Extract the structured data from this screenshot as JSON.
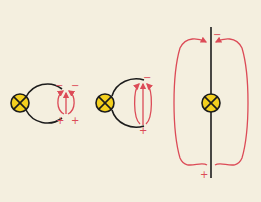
{
  "diagram": {
    "title": "",
    "background_color": "#f4efdf",
    "wire_color": "#1c1c1c",
    "field_color": "#dc4b57",
    "bulb_color": "#f4d01e",
    "panels": [
      {
        "id": "small-gap",
        "description": "Bulb connected to open wire loop with small gap; short field loops across gap",
        "signs": {
          "top_left": "−",
          "top_right": "−",
          "bottom_left": "+",
          "bottom_right": "+"
        }
      },
      {
        "id": "medium-gap",
        "description": "Bulb connected to wire loop with wider gap; elliptical field lines with arrow pointing up",
        "signs": {
          "top": "−",
          "bottom": "+"
        }
      },
      {
        "id": "straight-antenna",
        "description": "Bulb in straight vertical wire (dipole); large field loops from bottom to top",
        "signs": {
          "top": "−",
          "bottom": "+"
        }
      }
    ]
  }
}
